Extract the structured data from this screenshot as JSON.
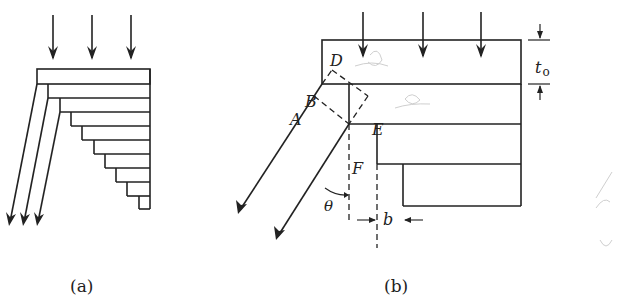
{
  "figure_a": {
    "caption": "(a)",
    "description": "Stack of plates shearing and sliding under vertical load; three slanted arrows point down-left"
  },
  "figure_b": {
    "caption": "(b)",
    "labels": {
      "A": "A",
      "B": "B",
      "D": "D",
      "E": "E",
      "F": "F",
      "theta": "θ",
      "b": "b",
      "t0": "t",
      "t0_sub": "o"
    }
  },
  "colors": {
    "line": "#222222",
    "background": "#ffffff",
    "faint_pencil": "#c8c8c8"
  }
}
